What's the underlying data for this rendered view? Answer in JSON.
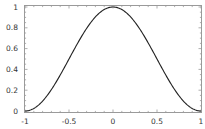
{
  "chart_data": {
    "type": "line",
    "title": "",
    "xlabel": "",
    "ylabel": "",
    "xlim": [
      -1,
      1
    ],
    "ylim": [
      0,
      1
    ],
    "grid": false,
    "legend": null,
    "x_ticks": [
      -1,
      -0.5,
      0,
      0.5,
      1
    ],
    "x_tick_labels": [
      "-1",
      "-0.5",
      "0",
      "0.5",
      "1"
    ],
    "y_ticks": [
      0,
      0.2,
      0.4,
      0.6,
      0.8,
      1
    ],
    "y_tick_labels": [
      "0",
      "0.2",
      "0.4",
      "0.6",
      "0.8",
      "1"
    ],
    "series": [
      {
        "name": "cos^2(pi x / 2)",
        "color": "#222222",
        "x": [
          -1,
          -0.9,
          -0.8,
          -0.7,
          -0.6,
          -0.5,
          -0.4,
          -0.3,
          -0.2,
          -0.1,
          0,
          0.1,
          0.2,
          0.3,
          0.4,
          0.5,
          0.6,
          0.7,
          0.8,
          0.9,
          1
        ],
        "y": [
          0,
          0.024,
          0.095,
          0.206,
          0.345,
          0.5,
          0.655,
          0.794,
          0.905,
          0.976,
          1,
          0.976,
          0.905,
          0.794,
          0.655,
          0.5,
          0.345,
          0.206,
          0.095,
          0.024,
          0
        ]
      }
    ]
  },
  "colors": {
    "frame": "#9a9a9a",
    "curve": "#222222",
    "label": "#333333"
  }
}
